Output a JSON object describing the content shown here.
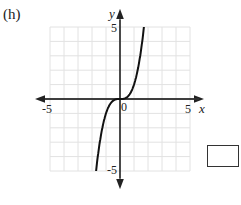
{
  "problem": {
    "label": "(h)",
    "function": "y = x^3"
  },
  "graph": {
    "x_axis_label": "x",
    "y_axis_label": "y",
    "x_ticks": {
      "min": "-5",
      "max": "5"
    },
    "y_ticks": {
      "min": "-5",
      "max": "5"
    },
    "origin_label": "0",
    "grid": true,
    "grid_color": "#e2e2e2",
    "curve_color": "#111111"
  },
  "chart_data": {
    "type": "line",
    "title": "(h)",
    "xlabel": "x",
    "ylabel": "y",
    "xlim": [
      -5,
      5
    ],
    "ylim": [
      -5,
      5
    ],
    "grid": true,
    "series": [
      {
        "name": "y = x^3",
        "x": [
          -1.71,
          -1.5,
          -1.25,
          -1,
          -0.75,
          -0.5,
          -0.25,
          0,
          0.25,
          0.5,
          0.75,
          1,
          1.25,
          1.5,
          1.71
        ],
        "values": [
          -5,
          -3.375,
          -1.95,
          -1,
          -0.42,
          -0.125,
          -0.016,
          0,
          0.016,
          0.125,
          0.42,
          1,
          1.95,
          3.375,
          5
        ]
      }
    ]
  },
  "answer_box": {
    "value": ""
  }
}
